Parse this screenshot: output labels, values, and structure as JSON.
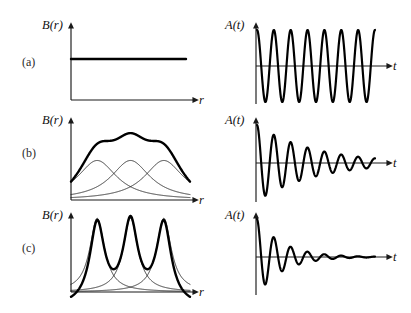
{
  "figure": {
    "background": "#ffffff",
    "ink": "#111111",
    "rows": [
      {
        "tag": "(a)",
        "left": {
          "ylabel": "B(r)",
          "xlabel": "r",
          "case": "uniform-field"
        },
        "right": {
          "ylabel": "A(t)",
          "xlabel": "t",
          "case": "undamped-oscillation"
        }
      },
      {
        "tag": "(b)",
        "left": {
          "ylabel": "B(r)",
          "xlabel": "r",
          "case": "broad-overlapping-peaks"
        },
        "right": {
          "ylabel": "A(t)",
          "xlabel": "t",
          "case": "moderately-damped-oscillation"
        }
      },
      {
        "tag": "(c)",
        "left": {
          "ylabel": "B(r)",
          "xlabel": "r",
          "case": "sharp-narrow-peaks"
        },
        "right": {
          "ylabel": "A(t)",
          "xlabel": "t",
          "case": "strongly-damped-oscillation"
        }
      }
    ]
  },
  "chart_data": [
    {
      "id": "a-left",
      "type": "line",
      "title": "",
      "xlabel": "r",
      "ylabel": "B(r)",
      "grid": false,
      "legend": null,
      "xlim": [
        0,
        1
      ],
      "ylim": [
        0,
        1
      ],
      "series": [
        {
          "name": "B(r) uniform",
          "style": "bold",
          "comment": "constant field, flat horizontal line",
          "x": [
            0,
            0.2,
            0.4,
            0.6,
            0.8,
            1.0
          ],
          "values": [
            0.62,
            0.62,
            0.62,
            0.62,
            0.62,
            0.62
          ]
        }
      ]
    },
    {
      "id": "a-right",
      "type": "line",
      "title": "",
      "xlabel": "t",
      "ylabel": "A(t)",
      "grid": false,
      "legend": null,
      "xlim": [
        0,
        1
      ],
      "ylim": [
        -1,
        1
      ],
      "series": [
        {
          "name": "A(t) undamped",
          "style": "bold",
          "comment": "constant amplitude sinusoid, about 7 cycles",
          "cycles": 7,
          "amplitude_start": 1.0,
          "amplitude_end": 1.0,
          "decay": 0.0
        }
      ]
    },
    {
      "id": "b-left",
      "type": "line",
      "title": "",
      "xlabel": "r",
      "ylabel": "B(r)",
      "grid": false,
      "legend": null,
      "xlim": [
        0,
        1
      ],
      "ylim": [
        0,
        1
      ],
      "series": [
        {
          "name": "component peaks (broad)",
          "style": "thin",
          "peak_centers": [
            0.22,
            0.5,
            0.78
          ],
          "peak_width": 0.2,
          "peak_height": 0.52
        },
        {
          "name": "sum B(r)",
          "style": "bold",
          "comment": "shallow ripple riding on a high baseline",
          "peak_centers": [
            0.22,
            0.5,
            0.78
          ],
          "ripple_max": 0.88,
          "ripple_min": 0.74
        }
      ]
    },
    {
      "id": "b-right",
      "type": "line",
      "title": "",
      "xlabel": "t",
      "ylabel": "A(t)",
      "grid": false,
      "legend": null,
      "xlim": [
        0,
        1
      ],
      "ylim": [
        -1,
        1
      ],
      "series": [
        {
          "name": "A(t) moderately damped",
          "style": "bold",
          "cycles": 7,
          "amplitude_start": 1.0,
          "amplitude_end": 0.12,
          "decay": 2.1
        }
      ]
    },
    {
      "id": "c-left",
      "type": "line",
      "title": "",
      "xlabel": "r",
      "ylabel": "B(r)",
      "grid": false,
      "legend": null,
      "xlim": [
        0,
        1
      ],
      "ylim": [
        0,
        1
      ],
      "series": [
        {
          "name": "component peaks (narrow)",
          "style": "thin",
          "peak_centers": [
            0.22,
            0.5,
            0.78
          ],
          "peak_width": 0.075,
          "peak_height": 0.97
        },
        {
          "name": "sum B(r)",
          "style": "bold",
          "comment": "sharp tall peaks with deep valleys",
          "peak_centers": [
            0.22,
            0.5,
            0.78
          ],
          "ripple_max": 1.0,
          "ripple_min": 0.3
        }
      ]
    },
    {
      "id": "c-right",
      "type": "line",
      "title": "",
      "xlabel": "t",
      "ylabel": "A(t)",
      "grid": false,
      "legend": null,
      "xlim": [
        0,
        1
      ],
      "ylim": [
        -1,
        1
      ],
      "series": [
        {
          "name": "A(t) strongly damped",
          "style": "bold",
          "cycles": 7,
          "amplitude_start": 1.0,
          "amplitude_end": 0.02,
          "decay": 4.6
        }
      ]
    }
  ]
}
